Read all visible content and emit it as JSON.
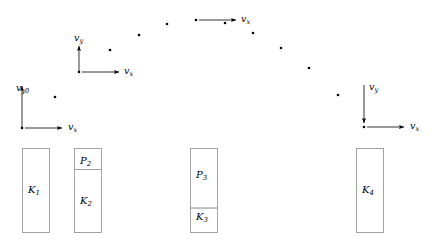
{
  "figure": {
    "width": 434,
    "height": 245,
    "background_color": "#ffffff",
    "ink_color": "#000000",
    "bar_stroke_color": "#999999"
  },
  "trajectory": {
    "description": "Parabolic path of projectile shown as a series of dots",
    "dot_radius": 1.3,
    "dot_color": "#000000",
    "points": [
      {
        "x": 22,
        "y": 128
      },
      {
        "x": 55,
        "y": 97
      },
      {
        "x": 79,
        "y": 72
      },
      {
        "x": 110,
        "y": 50
      },
      {
        "x": 139,
        "y": 35
      },
      {
        "x": 167,
        "y": 24
      },
      {
        "x": 196,
        "y": 20
      },
      {
        "x": 225,
        "y": 23
      },
      {
        "x": 253,
        "y": 33
      },
      {
        "x": 281,
        "y": 48
      },
      {
        "x": 309,
        "y": 68
      },
      {
        "x": 338,
        "y": 95
      },
      {
        "x": 364,
        "y": 127
      }
    ]
  },
  "vectors": [
    {
      "id": "launch",
      "origin_x": 22,
      "origin_y": 128,
      "vy": {
        "label": "v",
        "subscript": "y0",
        "direction": "up",
        "length": 42,
        "label_x": 16,
        "label_y": 83
      },
      "vx": {
        "label": "v",
        "subscript": "x",
        "direction": "right",
        "length": 40,
        "label_x": 68,
        "label_y": 122
      }
    },
    {
      "id": "rising",
      "origin_x": 79,
      "origin_y": 72,
      "vy": {
        "label": "v",
        "subscript": "y",
        "direction": "up",
        "length": 26,
        "label_x": 74,
        "label_y": 33
      },
      "vx": {
        "label": "v",
        "subscript": "x",
        "direction": "right",
        "length": 40,
        "label_x": 124,
        "label_y": 66
      }
    },
    {
      "id": "apex",
      "origin_x": 196,
      "origin_y": 20,
      "vy": null,
      "vx": {
        "label": "v",
        "subscript": "x",
        "direction": "right",
        "length": 40,
        "label_x": 241,
        "label_y": 14
      }
    },
    {
      "id": "landing",
      "origin_x": 364,
      "origin_y": 127,
      "vy": {
        "label": "v",
        "subscript": "y",
        "direction": "down",
        "length": 42,
        "label_x": 369,
        "label_y": 82
      },
      "vx": {
        "label": "v",
        "subscript": "x",
        "direction": "right",
        "length": 40,
        "label_x": 410,
        "label_y": 121
      }
    }
  ],
  "energy_bars": [
    {
      "id": "bar-1",
      "x": 22,
      "y": 148,
      "width": 27,
      "height": 84,
      "segments": [
        {
          "type": "kinetic",
          "label": "K",
          "subscript": "1",
          "fraction": 1.0,
          "label_x": 28,
          "label_y": 185
        }
      ]
    },
    {
      "id": "bar-2",
      "x": 74,
      "y": 148,
      "width": 27,
      "height": 84,
      "segments": [
        {
          "type": "potential",
          "label": "P",
          "subscript": "2",
          "fraction": 0.25,
          "label_x": 80,
          "label_y": 156
        },
        {
          "type": "kinetic",
          "label": "K",
          "subscript": "2",
          "fraction": 0.75,
          "label_x": 80,
          "label_y": 196
        }
      ]
    },
    {
      "id": "bar-3",
      "x": 190,
      "y": 148,
      "width": 27,
      "height": 84,
      "segments": [
        {
          "type": "potential",
          "label": "P",
          "subscript": "3",
          "fraction": 0.71,
          "label_x": 196,
          "label_y": 170
        },
        {
          "type": "kinetic",
          "label": "K",
          "subscript": "3",
          "fraction": 0.29,
          "label_x": 196,
          "label_y": 212
        }
      ]
    },
    {
      "id": "bar-4",
      "x": 356,
      "y": 148,
      "width": 27,
      "height": 84,
      "segments": [
        {
          "type": "kinetic",
          "label": "K",
          "subscript": "4",
          "fraction": 1.0,
          "label_x": 362,
          "label_y": 185
        }
      ]
    }
  ]
}
